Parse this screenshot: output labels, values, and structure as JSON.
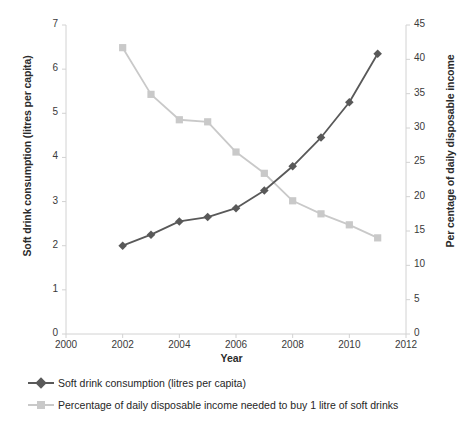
{
  "chart_data": {
    "type": "line",
    "title": "",
    "xlabel": "Year",
    "x": [
      2002,
      2003,
      2004,
      2005,
      2006,
      2007,
      2008,
      2009,
      2010,
      2011
    ],
    "xlim": [
      2000,
      2012
    ],
    "x_ticks": [
      2000,
      2002,
      2004,
      2006,
      2008,
      2010,
      2012
    ],
    "grid": false,
    "legend_position": "bottom-left",
    "axes": [
      {
        "id": "left",
        "label": "Soft drink consumption (litres per capita)",
        "lim": [
          0,
          7
        ],
        "ticks": [
          0,
          1,
          2,
          3,
          4,
          5,
          6,
          7
        ]
      },
      {
        "id": "right",
        "label": "Per centage of daily disposable income",
        "lim": [
          0,
          45
        ],
        "ticks": [
          0,
          5,
          10,
          15,
          20,
          25,
          30,
          35,
          40,
          45
        ]
      }
    ],
    "series": [
      {
        "name": "Soft drink consumption (litres per capita)",
        "axis": "left",
        "marker": "diamond",
        "color": "#595959",
        "values": [
          2.0,
          2.25,
          2.55,
          2.65,
          2.85,
          3.25,
          3.8,
          4.45,
          5.25,
          6.35
        ]
      },
      {
        "name": "Percentage of daily disposable income needed to buy 1 litre of soft drinks",
        "axis": "right",
        "marker": "square",
        "color": "#c9c9c9",
        "values": [
          41.7,
          34.9,
          31.2,
          30.9,
          26.5,
          23.4,
          19.4,
          17.5,
          15.9,
          14.0
        ]
      }
    ]
  },
  "axis_titles": {
    "left": "Soft drink consumption (litres per capita)",
    "right": "Per centage of daily disposable income",
    "x": "Year"
  },
  "ticks": {
    "left": [
      "7",
      "6",
      "5",
      "4",
      "3",
      "2",
      "1",
      "0"
    ],
    "right": [
      "45",
      "40",
      "35",
      "30",
      "25",
      "20",
      "15",
      "10",
      "5",
      "0"
    ],
    "x": [
      "2000",
      "2002",
      "2004",
      "2006",
      "2008",
      "2010",
      "2012"
    ]
  },
  "legend": {
    "items": [
      {
        "label": "Soft drink consumption (litres per capita)",
        "color": "#595959",
        "marker": "diamond"
      },
      {
        "label": "Percentage of daily disposable income needed to buy 1 litre of soft drinks",
        "color": "#c9c9c9",
        "marker": "square"
      }
    ]
  },
  "colors": {
    "series_dark": "#595959",
    "series_light": "#c9c9c9",
    "axis": "#d2d2d2",
    "text": "#333333"
  }
}
